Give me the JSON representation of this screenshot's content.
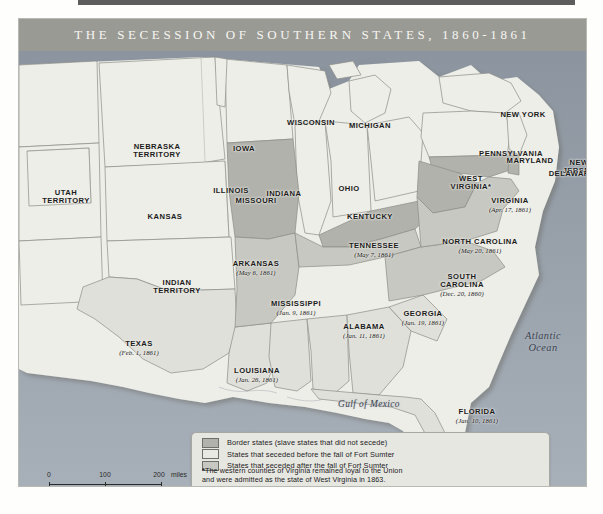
{
  "map": {
    "title": "THE SECESSION OF SOUTHERN STATES, 1860-1861",
    "water_labels": [
      {
        "name": "atlantic-ocean",
        "line1": "Atlantic",
        "line2": "Ocean"
      },
      {
        "name": "gulf-of-mexico",
        "line1": "Gulf of Mexico"
      }
    ],
    "regions": [
      {
        "name": "utah-territory",
        "label": "UTAH",
        "label2": "TERRITORY",
        "date": "",
        "category": "union"
      },
      {
        "name": "nebraska-territory",
        "label": "NEBRASKA",
        "label2": "TERRITORY",
        "date": "",
        "category": "union"
      },
      {
        "name": "indian-territory",
        "label": "INDIAN",
        "label2": "TERRITORY",
        "date": "",
        "category": "union"
      },
      {
        "name": "kansas",
        "label": "KANSAS",
        "label2": "",
        "date": "",
        "category": "union"
      },
      {
        "name": "iowa",
        "label": "IOWA",
        "label2": "",
        "date": "",
        "category": "union"
      },
      {
        "name": "wisconsin",
        "label": "WISCONSIN",
        "label2": "",
        "date": "",
        "category": "union"
      },
      {
        "name": "michigan",
        "label": "MICHIGAN",
        "label2": "",
        "date": "",
        "category": "union"
      },
      {
        "name": "illinois",
        "label": "ILLINOIS",
        "label2": "",
        "date": "",
        "category": "union"
      },
      {
        "name": "indiana",
        "label": "INDIANA",
        "label2": "",
        "date": "",
        "category": "union"
      },
      {
        "name": "ohio",
        "label": "OHIO",
        "label2": "",
        "date": "",
        "category": "union"
      },
      {
        "name": "new-york",
        "label": "NEW YORK",
        "label2": "",
        "date": "",
        "category": "union"
      },
      {
        "name": "pennsylvania",
        "label": "PENNSYLVANIA",
        "label2": "",
        "date": "",
        "category": "union"
      },
      {
        "name": "new-jersey",
        "label": "NEW",
        "label2": "JERSEY",
        "date": "",
        "category": "union"
      },
      {
        "name": "missouri",
        "label": "MISSOURI",
        "label2": "",
        "date": "",
        "category": "border"
      },
      {
        "name": "kentucky",
        "label": "KENTUCKY",
        "label2": "",
        "date": "",
        "category": "border"
      },
      {
        "name": "maryland",
        "label": "MARYLAND",
        "label2": "",
        "date": "",
        "category": "border"
      },
      {
        "name": "delaware",
        "label": "DELAWARE",
        "label2": "",
        "date": "",
        "category": "border"
      },
      {
        "name": "west-virginia",
        "label": "WEST",
        "label2": "VIRGINIA*",
        "date": "",
        "category": "border"
      },
      {
        "name": "south-carolina",
        "label": "SOUTH",
        "label2": "CAROLINA",
        "date": "(Dec. 20, 1860)",
        "category": "seceded-before"
      },
      {
        "name": "mississippi",
        "label": "MISSISSIPPI",
        "label2": "",
        "date": "(Jan. 9, 1861)",
        "category": "seceded-before"
      },
      {
        "name": "florida",
        "label": "FLORIDA",
        "label2": "",
        "date": "(Jan. 10, 1861)",
        "category": "seceded-before"
      },
      {
        "name": "alabama",
        "label": "ALABAMA",
        "label2": "",
        "date": "(Jan. 11, 1861)",
        "category": "seceded-before"
      },
      {
        "name": "georgia",
        "label": "GEORGIA",
        "label2": "",
        "date": "(Jan. 19, 1861)",
        "category": "seceded-before"
      },
      {
        "name": "louisiana",
        "label": "LOUISIANA",
        "label2": "",
        "date": "(Jan. 26, 1861)",
        "category": "seceded-before"
      },
      {
        "name": "texas",
        "label": "TEXAS",
        "label2": "",
        "date": "(Feb. 1, 1861)",
        "category": "seceded-before"
      },
      {
        "name": "virginia",
        "label": "VIRGINIA",
        "label2": "",
        "date": "(Apr. 17, 1861)",
        "category": "seceded-after"
      },
      {
        "name": "arkansas",
        "label": "ARKANSAS",
        "label2": "",
        "date": "(May 6, 1861)",
        "category": "seceded-after"
      },
      {
        "name": "tennessee",
        "label": "TENNESSEE",
        "label2": "",
        "date": "(May 7, 1861)",
        "category": "seceded-after"
      },
      {
        "name": "north-carolina",
        "label": "NORTH CAROLINA",
        "label2": "",
        "date": "(May 20, 1861)",
        "category": "seceded-after"
      }
    ]
  },
  "legend": {
    "items": [
      {
        "name": "border-states",
        "label": "Border states (slave states that did not secede)",
        "swatch": "#b2b2ac"
      },
      {
        "name": "seceded-before",
        "label": "States that seceded before the fall of Fort Sumter",
        "swatch": "#e3e3de"
      },
      {
        "name": "seceded-after",
        "label": "States that seceded after the fall of Fort Sumter",
        "swatch": "#c8c8c2"
      }
    ],
    "note_marker": "*",
    "note_line1": "The western counties of Virginia remained loyal to the Union",
    "note_line2": "and were admitted as the state of West Virginia in 1863."
  },
  "scale": {
    "miles": {
      "t0": "0",
      "t1": "100",
      "t2": "200",
      "unit": "miles"
    },
    "km": {
      "t0": "0",
      "t1": "100",
      "t2": "200",
      "unit": "kilometers"
    }
  },
  "colors": {
    "title_band": "#9a9a95",
    "ocean": "#9aa3ad",
    "union_fill": "#eeeee9",
    "border_fill": "#b2b2ac",
    "seceded_before_fill": "#e0e0da",
    "seceded_after_fill": "#c8c8c2"
  }
}
